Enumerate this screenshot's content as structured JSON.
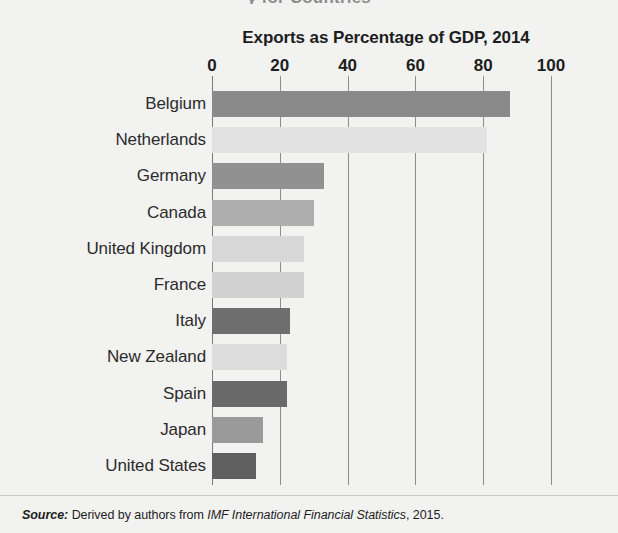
{
  "clipped_caption": "y for Countries",
  "chart_data": {
    "type": "bar",
    "orientation": "horizontal",
    "title": "Exports as Percentage of GDP, 2014",
    "xlabel": "",
    "ylabel": "",
    "xlim": [
      0,
      100
    ],
    "grid": true,
    "legend": "none",
    "ticks": [
      0,
      20,
      40,
      60,
      80,
      100
    ],
    "tick_labels": [
      "0",
      "20",
      "40",
      "60",
      "80",
      "100"
    ],
    "categories": [
      "Belgium",
      "Netherlands",
      "Germany",
      "Canada",
      "United Kingdom",
      "France",
      "Italy",
      "New Zealand",
      "Spain",
      "Japan",
      "United States"
    ],
    "values": [
      88,
      81,
      33,
      30,
      27,
      27,
      23,
      22,
      22,
      15,
      13
    ],
    "bar_colors": [
      "#8a8a8a",
      "#e2e2e2",
      "#919191",
      "#aeaeae",
      "#d8d8d8",
      "#d2d2d2",
      "#6e6e6e",
      "#dcdcdc",
      "#6a6a6a",
      "#9a9a9a",
      "#5f5f5f"
    ]
  },
  "source": {
    "label": "Source:",
    "text_before": " Derived by authors from ",
    "publication": "IMF International Financial Statistics",
    "text_after": ", 2015."
  },
  "colors": {
    "background": "#f2f2f1",
    "text": "#231f20",
    "gridline": "#8d8d8d"
  }
}
